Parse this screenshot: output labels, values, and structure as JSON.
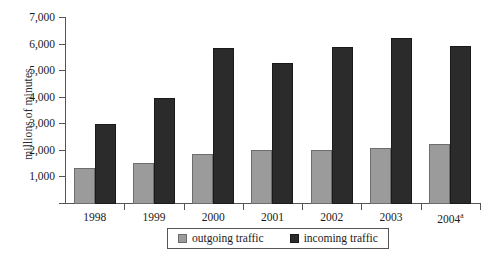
{
  "chart_data": {
    "type": "bar",
    "title": "",
    "xlabel": "",
    "ylabel": "millions of minutes",
    "categories": [
      "1998",
      "1999",
      "2000",
      "2001",
      "2002",
      "2003",
      "2004"
    ],
    "category_labels": [
      "1998",
      "1999",
      "2000",
      "2001",
      "2002",
      "2003",
      "2004a"
    ],
    "category_footnotes": [
      "",
      "",
      "",
      "",
      "",
      "",
      "a"
    ],
    "series": [
      {
        "name": "outgoing traffic",
        "color": "#9b9b9b",
        "values": [
          1350,
          1550,
          1880,
          2020,
          2020,
          2120,
          2270
        ]
      },
      {
        "name": "incoming traffic",
        "color": "#2b2b2b",
        "values": [
          3000,
          4000,
          5870,
          5300,
          5900,
          6250,
          5950
        ]
      }
    ],
    "ylim": [
      0,
      7000
    ],
    "yticks": [
      0,
      1000,
      2000,
      3000,
      4000,
      5000,
      6000,
      7000
    ],
    "ytick_labels": [
      "",
      "1,000",
      "2,000",
      "3,000",
      "4,000",
      "5,000",
      "6,000",
      "7,000"
    ],
    "grid": false,
    "legend_position": "bottom"
  },
  "legend": {
    "items": [
      {
        "label": "outgoing traffic",
        "swatch": "gray-swatch"
      },
      {
        "label": "incoming traffic",
        "swatch": "black-swatch"
      }
    ]
  },
  "artifacts": {
    "top_cropped_text": ""
  }
}
